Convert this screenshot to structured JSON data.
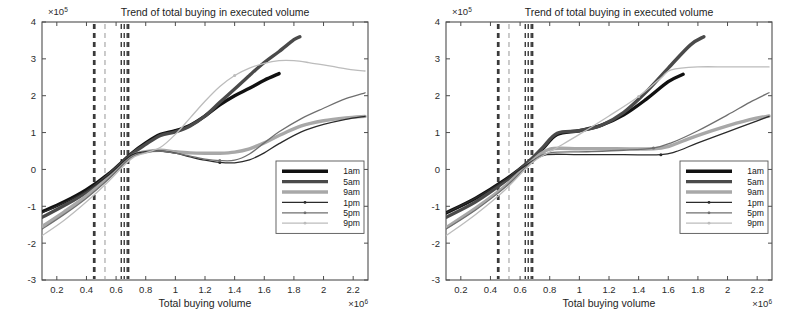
{
  "figure": {
    "panel_count": 2,
    "background_color": "#ffffff"
  },
  "chart_data": [
    {
      "panel": "left",
      "type": "line",
      "title": "Trend of total buying in executed volume",
      "xlabel": "Total buying volume",
      "ylabel": "",
      "x_exponent_label": "×10",
      "x_exponent_power": "6",
      "y_exponent_label": "×10",
      "y_exponent_power": "5",
      "xlim": [
        0.1,
        2.3
      ],
      "ylim": [
        -3,
        4
      ],
      "xticks": [
        0.2,
        0.4,
        0.6,
        0.8,
        1,
        1.2,
        1.4,
        1.6,
        1.8,
        2,
        2.2
      ],
      "xticklabels": [
        "0.2",
        "0.4",
        "0.6",
        "0.8",
        "1",
        "1.2",
        "1.4",
        "1.6",
        "1.8",
        "2",
        "2.2"
      ],
      "yticks": [
        -3,
        -2,
        -1,
        0,
        1,
        2,
        3,
        4
      ],
      "yticklabels": [
        "-3",
        "-2",
        "-1",
        "0",
        "1",
        "2",
        "3",
        "4"
      ],
      "grid": false,
      "legend_position": "lower right",
      "vertical_markers": [
        0.45,
        0.455,
        0.525,
        0.635,
        0.655,
        0.675,
        0.685
      ],
      "series": [
        {
          "name": "1am",
          "color": "#111111",
          "width": 3.4,
          "dash": "none",
          "marker": "none",
          "x": [
            0.1,
            0.25,
            0.4,
            0.55,
            0.7,
            0.8,
            0.9,
            1.0,
            1.1,
            1.2,
            1.3,
            1.4,
            1.5,
            1.6,
            1.7
          ],
          "y": [
            -1.15,
            -0.88,
            -0.55,
            -0.12,
            0.42,
            0.72,
            0.95,
            1.05,
            1.2,
            1.45,
            1.75,
            2.0,
            2.2,
            2.42,
            2.6
          ]
        },
        {
          "name": "5am",
          "color": "#4a4a4a",
          "width": 3.4,
          "dash": "none",
          "marker": "none",
          "x": [
            0.1,
            0.25,
            0.4,
            0.55,
            0.7,
            0.8,
            0.9,
            1.0,
            1.1,
            1.2,
            1.3,
            1.4,
            1.5,
            1.6,
            1.7,
            1.8,
            1.84
          ],
          "y": [
            -1.3,
            -0.98,
            -0.62,
            -0.15,
            0.4,
            0.68,
            0.92,
            1.02,
            1.18,
            1.45,
            1.82,
            2.18,
            2.55,
            2.9,
            3.2,
            3.52,
            3.6
          ]
        },
        {
          "name": "9am",
          "color": "#a8a8a8",
          "width": 3.4,
          "dash": "none",
          "marker": "none",
          "x": [
            0.1,
            0.25,
            0.4,
            0.55,
            0.7,
            0.8,
            0.9,
            1.0,
            1.1,
            1.2,
            1.3,
            1.4,
            1.5,
            1.6,
            1.7,
            1.85,
            2.0,
            2.15,
            2.28
          ],
          "y": [
            -1.55,
            -1.15,
            -0.72,
            -0.22,
            0.35,
            0.48,
            0.52,
            0.48,
            0.45,
            0.44,
            0.44,
            0.47,
            0.56,
            0.72,
            0.92,
            1.18,
            1.32,
            1.4,
            1.44
          ]
        },
        {
          "name": "1pm",
          "color": "#2b2b2b",
          "width": 1.3,
          "dash": "none",
          "marker": "dot",
          "x": [
            0.1,
            0.25,
            0.4,
            0.55,
            0.7,
            0.8,
            0.9,
            1.0,
            1.1,
            1.2,
            1.3,
            1.4,
            1.5,
            1.6,
            1.7,
            1.85,
            2.0,
            2.15,
            2.28
          ],
          "y": [
            -1.18,
            -0.9,
            -0.58,
            -0.15,
            0.38,
            0.48,
            0.5,
            0.44,
            0.34,
            0.25,
            0.19,
            0.18,
            0.26,
            0.45,
            0.7,
            1.02,
            1.22,
            1.36,
            1.44
          ]
        },
        {
          "name": "5pm",
          "color": "#6f6f6f",
          "width": 1.3,
          "dash": "none",
          "marker": "dot",
          "x": [
            0.1,
            0.25,
            0.4,
            0.55,
            0.7,
            0.8,
            0.9,
            1.0,
            1.1,
            1.2,
            1.3,
            1.4,
            1.5,
            1.6,
            1.7,
            1.85,
            2.0,
            2.15,
            2.28
          ],
          "y": [
            -1.62,
            -1.22,
            -0.78,
            -0.26,
            0.32,
            0.46,
            0.5,
            0.44,
            0.36,
            0.28,
            0.24,
            0.25,
            0.42,
            0.72,
            1.02,
            1.38,
            1.66,
            1.92,
            2.08
          ]
        },
        {
          "name": "9pm",
          "color": "#bcbcbc",
          "width": 1.3,
          "dash": "none",
          "marker": "dot",
          "x": [
            0.1,
            0.25,
            0.4,
            0.55,
            0.7,
            0.8,
            0.9,
            1.0,
            1.1,
            1.2,
            1.3,
            1.4,
            1.5,
            1.6,
            1.7,
            1.8,
            1.9,
            2.05,
            2.2,
            2.28
          ],
          "y": [
            -1.8,
            -1.38,
            -0.88,
            -0.32,
            0.28,
            0.45,
            0.6,
            0.95,
            1.4,
            1.85,
            2.25,
            2.55,
            2.75,
            2.88,
            2.95,
            2.95,
            2.9,
            2.8,
            2.7,
            2.67
          ]
        }
      ],
      "legend": [
        "1am",
        "5am",
        "9am",
        "1pm",
        "5pm",
        "9pm"
      ]
    },
    {
      "panel": "right",
      "type": "line",
      "title": "Trend of total buying in executed volume",
      "xlabel": "Total buying volume",
      "ylabel": "",
      "x_exponent_label": "×10",
      "x_exponent_power": "6",
      "y_exponent_label": "×10",
      "y_exponent_power": "5",
      "xlim": [
        0.1,
        2.3
      ],
      "ylim": [
        -3,
        4
      ],
      "xticks": [
        0.2,
        0.4,
        0.6,
        0.8,
        1,
        1.2,
        1.4,
        1.6,
        1.8,
        2,
        2.2
      ],
      "xticklabels": [
        "0.2",
        "0.4",
        "0.6",
        "0.8",
        "1",
        "1.2",
        "1.4",
        "1.6",
        "1.8",
        "2",
        "2.2"
      ],
      "yticks": [
        -3,
        -2,
        -1,
        0,
        1,
        2,
        3,
        4
      ],
      "yticklabels": [
        "-3",
        "-2",
        "-1",
        "0",
        "1",
        "2",
        "3",
        "4"
      ],
      "grid": false,
      "legend_position": "lower right",
      "vertical_markers": [
        0.45,
        0.455,
        0.525,
        0.635,
        0.655,
        0.675,
        0.685
      ],
      "series": [
        {
          "name": "1am",
          "color": "#111111",
          "width": 3.4,
          "dash": "none",
          "marker": "none",
          "x": [
            0.1,
            0.3,
            0.5,
            0.65,
            0.75,
            0.85,
            1.0,
            1.15,
            1.3,
            1.45,
            1.6,
            1.7
          ],
          "y": [
            -1.18,
            -0.78,
            -0.28,
            0.18,
            0.55,
            0.95,
            1.05,
            1.2,
            1.48,
            1.9,
            2.38,
            2.58
          ]
        },
        {
          "name": "5am",
          "color": "#4a4a4a",
          "width": 3.4,
          "dash": "none",
          "marker": "none",
          "x": [
            0.1,
            0.3,
            0.5,
            0.65,
            0.75,
            0.85,
            1.0,
            1.15,
            1.3,
            1.45,
            1.6,
            1.75,
            1.84
          ],
          "y": [
            -1.3,
            -0.88,
            -0.32,
            0.18,
            0.58,
            0.98,
            1.05,
            1.2,
            1.55,
            2.1,
            2.75,
            3.38,
            3.6
          ]
        },
        {
          "name": "9am",
          "color": "#a8a8a8",
          "width": 3.4,
          "dash": "none",
          "marker": "none",
          "x": [
            0.1,
            0.3,
            0.5,
            0.68,
            0.8,
            1.0,
            1.25,
            1.5,
            1.6,
            1.75,
            1.95,
            2.15,
            2.28
          ],
          "y": [
            -1.58,
            -1.05,
            -0.45,
            0.22,
            0.55,
            0.56,
            0.56,
            0.56,
            0.62,
            0.85,
            1.12,
            1.35,
            1.45
          ]
        },
        {
          "name": "1pm",
          "color": "#2b2b2b",
          "width": 1.3,
          "dash": "none",
          "marker": "dot",
          "x": [
            0.1,
            0.3,
            0.5,
            0.68,
            0.78,
            1.0,
            1.3,
            1.55,
            1.65,
            1.8,
            2.0,
            2.2,
            2.28
          ],
          "y": [
            -1.18,
            -0.78,
            -0.28,
            0.22,
            0.4,
            0.4,
            0.4,
            0.4,
            0.48,
            0.72,
            1.02,
            1.32,
            1.44
          ]
        },
        {
          "name": "5pm",
          "color": "#6f6f6f",
          "width": 1.3,
          "dash": "none",
          "marker": "dot",
          "x": [
            0.1,
            0.3,
            0.5,
            0.68,
            0.8,
            1.05,
            1.3,
            1.5,
            1.62,
            1.8,
            2.0,
            2.15,
            2.28
          ],
          "y": [
            -1.62,
            -1.1,
            -0.48,
            0.2,
            0.45,
            0.48,
            0.52,
            0.58,
            0.72,
            1.05,
            1.48,
            1.82,
            2.08
          ]
        },
        {
          "name": "9pm",
          "color": "#bcbcbc",
          "width": 1.3,
          "dash": "none",
          "marker": "dot",
          "x": [
            0.1,
            0.3,
            0.5,
            0.68,
            0.82,
            1.0,
            1.2,
            1.4,
            1.55,
            1.62,
            1.8,
            2.0,
            2.2,
            2.28
          ],
          "y": [
            -1.8,
            -1.22,
            -0.55,
            0.18,
            0.52,
            0.95,
            1.45,
            1.98,
            2.48,
            2.7,
            2.78,
            2.78,
            2.78,
            2.78
          ]
        }
      ],
      "legend": [
        "1am",
        "5am",
        "9am",
        "1pm",
        "5pm",
        "9pm"
      ]
    }
  ]
}
